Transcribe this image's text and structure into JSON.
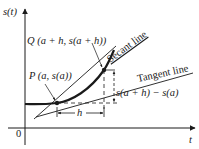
{
  "diagram": {
    "axes": {
      "y_label": "s(t)",
      "x_label": "t",
      "origin_label": "0"
    },
    "points": {
      "P": {
        "label": "P (a, s(a))"
      },
      "Q": {
        "label": "Q (a + h, s(a + h))"
      }
    },
    "lines": {
      "secant": {
        "label": "Secant line"
      },
      "tangent": {
        "label": "Tangent line"
      }
    },
    "measures": {
      "horizontal": {
        "label": "h"
      },
      "vertical": {
        "label": "s(a + h) − s(a)"
      }
    },
    "colors": {
      "ink": "#1a1a1a",
      "background": "#ffffff"
    }
  }
}
